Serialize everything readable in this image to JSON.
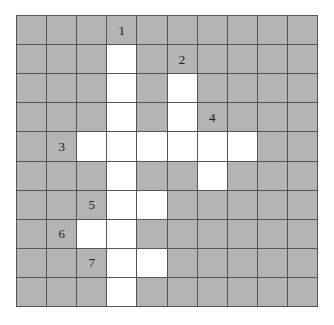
{
  "puzzle": {
    "type": "crossword-grid",
    "rows": 10,
    "cols": 10,
    "colors": {
      "block": "#b4b4b4",
      "open": "#ffffff",
      "line": "#555555"
    },
    "open_cells": [
      [
        1,
        3
      ],
      [
        2,
        3
      ],
      [
        3,
        3
      ],
      [
        4,
        3
      ],
      [
        5,
        3
      ],
      [
        6,
        3
      ],
      [
        7,
        3
      ],
      [
        8,
        3
      ],
      [
        9,
        3
      ],
      [
        2,
        5
      ],
      [
        3,
        5
      ],
      [
        4,
        5
      ],
      [
        5,
        6
      ],
      [
        4,
        2
      ],
      [
        4,
        4
      ],
      [
        4,
        6
      ],
      [
        4,
        7
      ],
      [
        6,
        4
      ],
      [
        7,
        2
      ],
      [
        8,
        4
      ]
    ],
    "labels": [
      {
        "num": "1",
        "row": 0,
        "col": 3
      },
      {
        "num": "2",
        "row": 1,
        "col": 5
      },
      {
        "num": "3",
        "row": 4,
        "col": 1
      },
      {
        "num": "4",
        "row": 3,
        "col": 6
      },
      {
        "num": "5",
        "row": 6,
        "col": 2
      },
      {
        "num": "6",
        "row": 7,
        "col": 1
      },
      {
        "num": "7",
        "row": 8,
        "col": 2
      }
    ]
  }
}
